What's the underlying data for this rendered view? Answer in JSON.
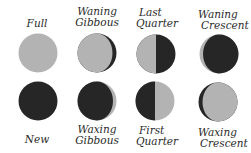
{
  "diagram": {
    "colors": {
      "lit": "#b3b3b3",
      "dark": "#262626",
      "background": "#ffffff",
      "text": "#2a2a2a"
    },
    "top_row": [
      {
        "name": "full",
        "label_line1": "Full",
        "label_line2": "",
        "phase": "full"
      },
      {
        "name": "waning-gibbous",
        "label_line1": "Waning",
        "label_line2": "Gibbous",
        "phase": "waning-gibbous"
      },
      {
        "name": "last-quarter",
        "label_line1": "Last",
        "label_line2": "Quarter",
        "phase": "last-quarter"
      },
      {
        "name": "waning-crescent",
        "label_line1": "Waning",
        "label_line2": "Crescent",
        "phase": "waning-crescent"
      }
    ],
    "bottom_row": [
      {
        "name": "new",
        "label_line1": "New",
        "label_line2": "",
        "phase": "new"
      },
      {
        "name": "waxing-gibbous",
        "label_line1": "Waxing",
        "label_line2": "Gibbous",
        "phase": "waxing-gibbous"
      },
      {
        "name": "first-quarter",
        "label_line1": "First",
        "label_line2": "Quarter",
        "phase": "first-quarter"
      },
      {
        "name": "waxing-crescent",
        "label_line1": "Waxing",
        "label_line2": "Crescent",
        "phase": "waxing-crescent"
      }
    ]
  }
}
